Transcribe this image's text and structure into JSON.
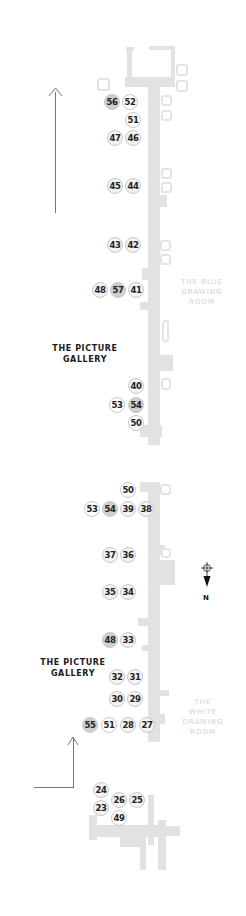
{
  "map": {
    "title": "Floor plan tour route",
    "rooms": {
      "picture_gallery_top": {
        "line1": "THE PICTURE",
        "line2": "GALLERY"
      },
      "picture_gallery_bottom": {
        "line1": "THE PICTURE",
        "line2": "GALLERY"
      },
      "blue_drawing_room": {
        "line1": "THE BLUE",
        "line2": "DRAWING",
        "line3": "ROOM"
      },
      "white_drawing_room": {
        "line1": "THE",
        "line2": "WHITE",
        "line3": "DRAWING",
        "line4": "ROOM"
      }
    },
    "compass": {
      "label": "N",
      "direction": "down"
    },
    "colors": {
      "wall": "#e2e2e2",
      "pin_light": "#f2f2f2",
      "pin_dark": "#cfcfcf",
      "text": "#222222",
      "room_label_light": "#d2d2d2",
      "arrow": "#777777"
    },
    "top_section_pins": [
      {
        "n": "56",
        "x": 104,
        "y": 94,
        "tone": "dark"
      },
      {
        "n": "52",
        "x": 122,
        "y": 94,
        "tone": "white"
      },
      {
        "n": "51",
        "x": 125,
        "y": 112,
        "tone": "white"
      },
      {
        "n": "47",
        "x": 107,
        "y": 130,
        "tone": "light"
      },
      {
        "n": "46",
        "x": 125,
        "y": 130,
        "tone": "light"
      },
      {
        "n": "45",
        "x": 107,
        "y": 178,
        "tone": "light"
      },
      {
        "n": "44",
        "x": 125,
        "y": 178,
        "tone": "light"
      },
      {
        "n": "43",
        "x": 107,
        "y": 237,
        "tone": "light"
      },
      {
        "n": "42",
        "x": 125,
        "y": 237,
        "tone": "light"
      },
      {
        "n": "48",
        "x": 92,
        "y": 282,
        "tone": "light"
      },
      {
        "n": "57",
        "x": 110,
        "y": 282,
        "tone": "dark"
      },
      {
        "n": "41",
        "x": 128,
        "y": 282,
        "tone": "light"
      },
      {
        "n": "40",
        "x": 128,
        "y": 378,
        "tone": "light"
      },
      {
        "n": "53",
        "x": 109,
        "y": 397,
        "tone": "white"
      },
      {
        "n": "54",
        "x": 128,
        "y": 397,
        "tone": "dark"
      },
      {
        "n": "50",
        "x": 128,
        "y": 415,
        "tone": "white"
      }
    ],
    "bottom_section_pins": [
      {
        "n": "50",
        "x": 120,
        "y": 482,
        "tone": "white"
      },
      {
        "n": "53",
        "x": 84,
        "y": 501,
        "tone": "white"
      },
      {
        "n": "54",
        "x": 102,
        "y": 501,
        "tone": "dark"
      },
      {
        "n": "39",
        "x": 120,
        "y": 501,
        "tone": "light"
      },
      {
        "n": "38",
        "x": 138,
        "y": 501,
        "tone": "light"
      },
      {
        "n": "37",
        "x": 102,
        "y": 547,
        "tone": "light"
      },
      {
        "n": "36",
        "x": 120,
        "y": 547,
        "tone": "light"
      },
      {
        "n": "35",
        "x": 102,
        "y": 584,
        "tone": "light"
      },
      {
        "n": "34",
        "x": 120,
        "y": 584,
        "tone": "light"
      },
      {
        "n": "48",
        "x": 102,
        "y": 632,
        "tone": "dark"
      },
      {
        "n": "33",
        "x": 120,
        "y": 632,
        "tone": "light"
      },
      {
        "n": "32",
        "x": 109,
        "y": 669,
        "tone": "light"
      },
      {
        "n": "31",
        "x": 127,
        "y": 669,
        "tone": "light"
      },
      {
        "n": "30",
        "x": 109,
        "y": 691,
        "tone": "light"
      },
      {
        "n": "29",
        "x": 127,
        "y": 691,
        "tone": "light"
      },
      {
        "n": "55",
        "x": 82,
        "y": 717,
        "tone": "dark"
      },
      {
        "n": "51",
        "x": 101,
        "y": 717,
        "tone": "white"
      },
      {
        "n": "28",
        "x": 120,
        "y": 717,
        "tone": "light"
      },
      {
        "n": "27",
        "x": 139,
        "y": 717,
        "tone": "light"
      },
      {
        "n": "24",
        "x": 93,
        "y": 782,
        "tone": "light"
      },
      {
        "n": "26",
        "x": 111,
        "y": 792,
        "tone": "light"
      },
      {
        "n": "25",
        "x": 129,
        "y": 792,
        "tone": "light"
      },
      {
        "n": "23",
        "x": 93,
        "y": 800,
        "tone": "light"
      },
      {
        "n": "49",
        "x": 111,
        "y": 810,
        "tone": "white"
      }
    ]
  }
}
